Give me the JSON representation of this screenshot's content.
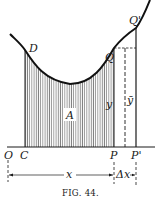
{
  "figure": {
    "caption": "FIG. 44.",
    "points": {
      "O": "O",
      "C": "C",
      "D": "D",
      "P": "P",
      "P_prime": "P'",
      "Q": "Q",
      "Q_prime": "Q'"
    },
    "region_label": "A",
    "ordinate_label": "y",
    "ordinate_bar_label": "ȳ",
    "dimensions": {
      "x_label": "x",
      "dx_label": "Δx"
    },
    "colors": {
      "ink": "#1a1a1a",
      "background": "#ffffff"
    }
  }
}
